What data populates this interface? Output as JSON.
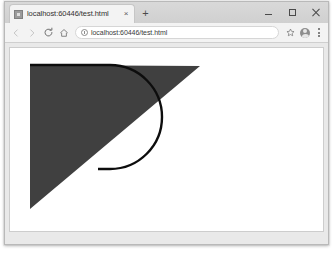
{
  "window": {
    "controls": {
      "minimize_label": "Minimize",
      "maximize_label": "Maximize",
      "close_label": "Close"
    }
  },
  "tab_strip": {
    "tabs": [
      {
        "title": "localhost:60446/test.html",
        "favicon": "generic-page-favicon",
        "close_label": "×",
        "active": true
      }
    ],
    "new_tab_label": "+"
  },
  "toolbar": {
    "back_label": "Back",
    "forward_label": "Forward",
    "reload_label": "Reload",
    "home_label": "Home",
    "omnibox": {
      "url": "localhost:60446/test.html",
      "placeholder": "Search Google or type a URL",
      "security_icon": "info-circle-icon"
    },
    "bookmark_label": "Bookmark this page",
    "profile_label": "Profile",
    "menu_label": "Customize and control Google Chrome"
  },
  "page": {
    "graphic": {
      "type": "triangle-with-arc",
      "fill_color": "#404040",
      "stroke_color": "#0d0d0d",
      "stroke_width": 2.4,
      "triangle_points": "20,17 190,18 20,161",
      "arc_path": "M 20,17 L 100,17 A 52,52 0 0 1 100,121 L 88,121",
      "background_color": "#ffffff"
    }
  }
}
